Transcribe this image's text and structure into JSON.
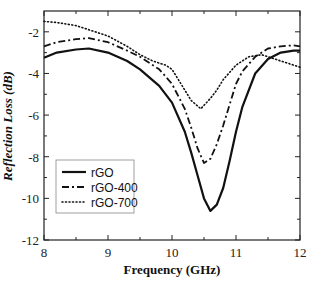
{
  "chart_data": {
    "type": "line",
    "title": "",
    "xlabel": "Frequency (GHz)",
    "ylabel": "Reflection Loss (dB)",
    "xlim": [
      8,
      12
    ],
    "ylim": [
      -12,
      -1
    ],
    "xticks": [
      8,
      9,
      10,
      11,
      12
    ],
    "yticks": [
      -2,
      -4,
      -6,
      -8,
      -10,
      -12
    ],
    "grid": false,
    "legend_position": "lower left",
    "series": [
      {
        "name": "rGO",
        "style": "solid",
        "x": [
          8.0,
          8.2,
          8.5,
          8.7,
          9.0,
          9.3,
          9.5,
          9.8,
          10.0,
          10.2,
          10.3,
          10.4,
          10.5,
          10.6,
          10.7,
          10.8,
          10.9,
          11.0,
          11.1,
          11.3,
          11.5,
          11.7,
          11.9,
          12.0
        ],
        "y": [
          -3.25,
          -3.0,
          -2.85,
          -2.8,
          -3.0,
          -3.4,
          -3.8,
          -4.6,
          -5.4,
          -6.8,
          -7.8,
          -8.9,
          -10.0,
          -10.6,
          -10.3,
          -9.5,
          -8.2,
          -6.8,
          -5.6,
          -4.0,
          -3.3,
          -3.0,
          -2.9,
          -2.9
        ]
      },
      {
        "name": "rGO-400",
        "style": "dash-dot",
        "x": [
          8.0,
          8.2,
          8.5,
          8.7,
          9.0,
          9.3,
          9.5,
          9.8,
          10.0,
          10.2,
          10.3,
          10.4,
          10.5,
          10.6,
          10.7,
          10.8,
          10.9,
          11.0,
          11.1,
          11.3,
          11.5,
          11.7,
          11.9,
          12.0
        ],
        "y": [
          -2.7,
          -2.5,
          -2.35,
          -2.3,
          -2.5,
          -2.9,
          -3.2,
          -3.8,
          -4.5,
          -5.7,
          -6.6,
          -7.6,
          -8.3,
          -8.1,
          -7.4,
          -6.5,
          -5.5,
          -4.5,
          -3.9,
          -3.2,
          -2.8,
          -2.7,
          -2.65,
          -2.7
        ]
      },
      {
        "name": "rGO-700",
        "style": "dotted",
        "x": [
          8.0,
          8.2,
          8.5,
          8.7,
          9.0,
          9.3,
          9.5,
          9.7,
          9.9,
          10.0,
          10.2,
          10.3,
          10.45,
          10.6,
          10.7,
          10.8,
          11.0,
          11.2,
          11.4,
          11.6,
          11.8,
          12.0
        ],
        "y": [
          -1.5,
          -1.55,
          -1.7,
          -1.9,
          -2.2,
          -2.7,
          -3.1,
          -3.4,
          -3.6,
          -3.8,
          -4.8,
          -5.3,
          -5.7,
          -5.2,
          -4.8,
          -4.3,
          -3.6,
          -3.2,
          -3.1,
          -3.3,
          -3.5,
          -3.7
        ]
      }
    ]
  },
  "legend": {
    "items": [
      "rGO",
      "rGO-400",
      "rGO-700"
    ]
  }
}
